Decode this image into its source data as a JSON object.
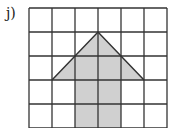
{
  "label": "j)",
  "grid": {
    "cols": 6,
    "rows": 5,
    "x0": 29,
    "y0": 8,
    "cell_w": 23,
    "cell_h": 24,
    "line_color": "#333333"
  },
  "shape": {
    "fill": "#d0d0d0",
    "stroke": "#333333",
    "points": "52,80 98,32 144,80 121,80 121,128 75,128 75,80"
  }
}
